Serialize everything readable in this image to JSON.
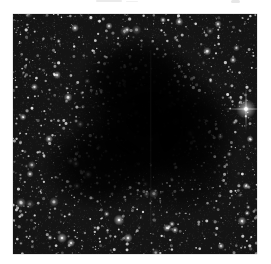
{
  "page": {
    "width": 271,
    "height": 264,
    "background": "#ffffff",
    "scan_artifacts": [
      {
        "x": 96,
        "y": 0,
        "w": 26,
        "h": 2,
        "alpha": 0.1
      },
      {
        "x": 126,
        "y": 1,
        "w": 12,
        "h": 1,
        "alpha": 0.07
      },
      {
        "x": 231,
        "y": 0,
        "w": 9,
        "h": 3,
        "alpha": 0.12
      }
    ]
  },
  "photo": {
    "subject": "dark-molecular-cloud-against-milky-way-star-field",
    "left": 13,
    "top": 14,
    "width": 244,
    "height": 240,
    "seed": 20240617,
    "colors": {
      "sky": "#141414",
      "grain": "#ffffff",
      "star": "#eaeaea",
      "cloud": "#000000",
      "bright_star_core": "#ffffff"
    },
    "star_field": {
      "count": 1550,
      "min_radius": 0.35,
      "radius_spread": 1.25,
      "min_alpha": 0.22,
      "alpha_spread": 0.72,
      "glow_chance": 0.05
    },
    "grain": {
      "count": 7000,
      "min_alpha": 0.03,
      "alpha_spread": 0.13
    },
    "cloud_blobs": [
      {
        "cx": 132,
        "cy": 104,
        "rx": 78,
        "ry": 74,
        "alpha": 0.93
      },
      {
        "cx": 138,
        "cy": 112,
        "rx": 52,
        "ry": 50,
        "alpha": 0.85
      },
      {
        "cx": 90,
        "cy": 152,
        "rx": 62,
        "ry": 46,
        "alpha": 0.88
      },
      {
        "cx": 178,
        "cy": 118,
        "rx": 50,
        "ry": 55,
        "alpha": 0.78
      },
      {
        "cx": 125,
        "cy": 62,
        "rx": 58,
        "ry": 42,
        "alpha": 0.8
      },
      {
        "cx": 168,
        "cy": 163,
        "rx": 55,
        "ry": 40,
        "alpha": 0.55
      }
    ],
    "streak": {
      "x": 137,
      "y1": 36,
      "y2": 212,
      "width": 1.4,
      "alpha": 0.035
    },
    "bright_stars": [
      {
        "x": 233,
        "y": 95,
        "r": 3.4,
        "halo": 10,
        "spike": true
      },
      {
        "x": 106,
        "y": 206,
        "r": 2.0,
        "halo": 5.5,
        "spike": false
      },
      {
        "x": 49,
        "y": 224,
        "r": 1.8,
        "halo": 5.0,
        "spike": false
      },
      {
        "x": 58,
        "y": 229,
        "r": 1.5,
        "halo": 4.0,
        "spike": false
      },
      {
        "x": 115,
        "y": 224,
        "r": 1.7,
        "halo": 4.5,
        "spike": false
      },
      {
        "x": 154,
        "y": 214,
        "r": 1.5,
        "halo": 4.0,
        "spike": false
      },
      {
        "x": 162,
        "y": 216,
        "r": 1.4,
        "halo": 3.5,
        "spike": false
      },
      {
        "x": 159,
        "y": 210,
        "r": 1.2,
        "halo": 3.0,
        "spike": false
      },
      {
        "x": 229,
        "y": 207,
        "r": 1.7,
        "halo": 4.5,
        "spike": false
      },
      {
        "x": 36,
        "y": 125,
        "r": 1.6,
        "halo": 4.0,
        "spike": false
      },
      {
        "x": 10,
        "y": 103,
        "r": 1.4,
        "halo": 3.5,
        "spike": false
      },
      {
        "x": 17,
        "y": 160,
        "r": 1.4,
        "halo": 3.5,
        "spike": false
      },
      {
        "x": 62,
        "y": 14,
        "r": 1.5,
        "halo": 4.0,
        "spike": false
      },
      {
        "x": 44,
        "y": 61,
        "r": 1.5,
        "halo": 4.0,
        "spike": false
      },
      {
        "x": 96,
        "y": 12,
        "r": 1.4,
        "halo": 3.5,
        "spike": false
      },
      {
        "x": 150,
        "y": 6,
        "r": 1.3,
        "halo": 3.0,
        "spike": false
      },
      {
        "x": 205,
        "y": 10,
        "r": 1.4,
        "halo": 3.5,
        "spike": false
      },
      {
        "x": 220,
        "y": 46,
        "r": 1.3,
        "halo": 3.5,
        "spike": false
      },
      {
        "x": 237,
        "y": 125,
        "r": 1.3,
        "halo": 3.5,
        "spike": false
      },
      {
        "x": 233,
        "y": 172,
        "r": 1.3,
        "halo": 3.5,
        "spike": false
      },
      {
        "x": 208,
        "y": 232,
        "r": 1.3,
        "halo": 3.5,
        "spike": false
      }
    ]
  }
}
